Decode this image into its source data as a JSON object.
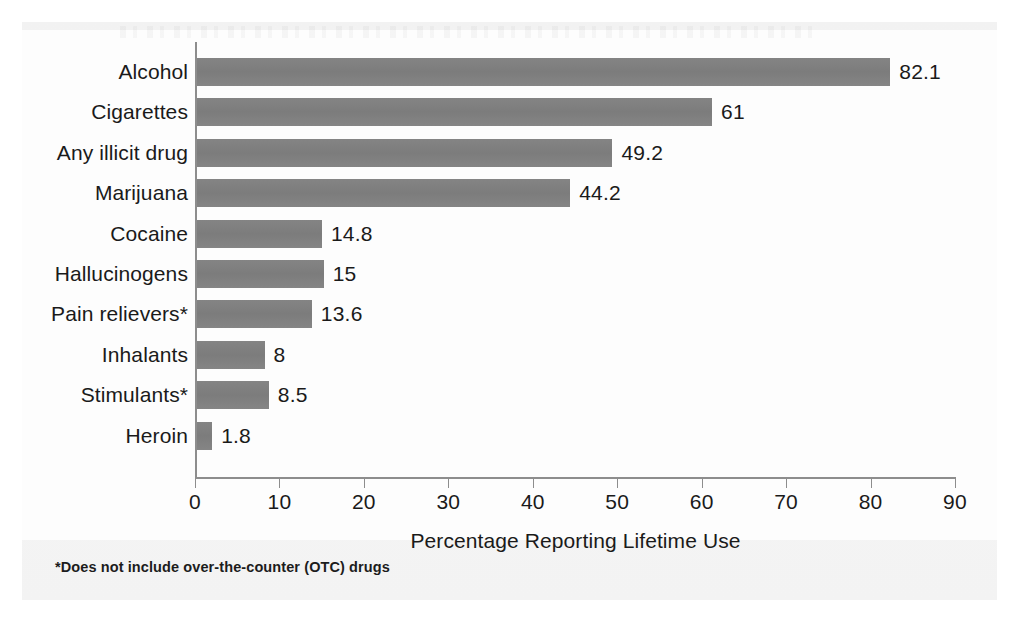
{
  "chart_data": {
    "type": "bar",
    "orientation": "horizontal",
    "title": "",
    "xlabel": "Percentage Reporting Lifetime Use",
    "ylabel": "",
    "xlim": [
      0,
      90
    ],
    "xticks": [
      0,
      10,
      20,
      30,
      40,
      50,
      60,
      70,
      80,
      90
    ],
    "xtick_labels": [
      "0",
      "10",
      "20",
      "30",
      "40",
      "50",
      "60",
      "70",
      "80",
      "90"
    ],
    "grid": false,
    "legend": null,
    "bar_color": "#808080",
    "categories": [
      "Alcohol",
      "Cigarettes",
      "Any illicit drug",
      "Marijuana",
      "Cocaine",
      "Hallucinogens",
      "Pain relievers*",
      "Inhalants",
      "Stimulants*",
      "Heroin"
    ],
    "values": [
      82.1,
      61,
      49.2,
      44.2,
      14.8,
      15,
      13.6,
      8,
      8.5,
      1.8
    ],
    "value_labels": [
      "82.1",
      "61",
      "49.2",
      "44.2",
      "14.8",
      "15",
      "13.6",
      "8",
      "8.5",
      "1.8"
    ],
    "annotations": [
      "*Does not include over-the-counter (OTC) drugs"
    ]
  },
  "footnote": "*Does not include over-the-counter (OTC) drugs"
}
